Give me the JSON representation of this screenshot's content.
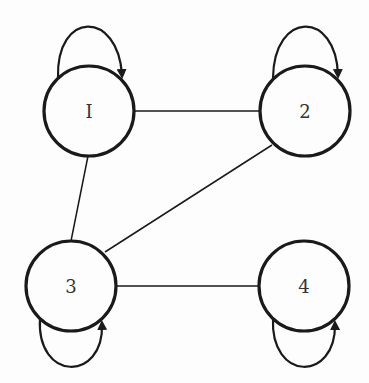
{
  "diagram": {
    "type": "undirected graph with self-loops",
    "nodes": [
      {
        "id": "1",
        "label": "I",
        "cx": 89,
        "cy": 111,
        "r": 45
      },
      {
        "id": "2",
        "label": "2",
        "cx": 305,
        "cy": 111,
        "r": 45
      },
      {
        "id": "3",
        "label": "3",
        "cx": 71,
        "cy": 286,
        "r": 45
      },
      {
        "id": "4",
        "label": "4",
        "cx": 304,
        "cy": 286,
        "r": 45
      }
    ],
    "edges": [
      {
        "from": "1",
        "to": "2"
      },
      {
        "from": "1",
        "to": "3"
      },
      {
        "from": "2",
        "to": "3"
      },
      {
        "from": "3",
        "to": "4"
      }
    ],
    "self_loops": [
      {
        "node": "1",
        "position": "top"
      },
      {
        "node": "2",
        "position": "top"
      },
      {
        "node": "3",
        "position": "bottom"
      },
      {
        "node": "4",
        "position": "bottom"
      }
    ],
    "colors": {
      "stroke": "#1a1a1a",
      "background": "#fdfdfd",
      "label": "#333333"
    }
  }
}
